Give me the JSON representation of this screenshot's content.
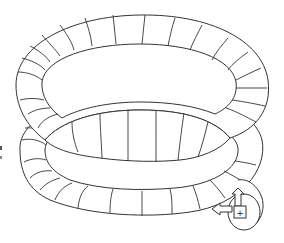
{
  "diagram": {
    "turns": 2,
    "stroke_color": "#333333",
    "background": "#ffffff",
    "end_marker": {
      "icon": "direction-arrows-icon",
      "center_glyph": "+"
    }
  }
}
